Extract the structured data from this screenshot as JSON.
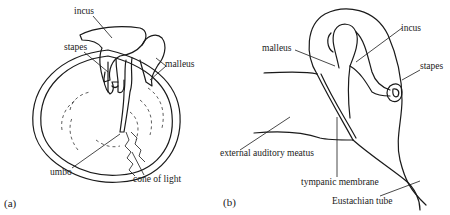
{
  "figure": {
    "panel_a": {
      "label": "(a)",
      "parts": {
        "incus": "incus",
        "stapes": "stapes",
        "malleus": "malleus",
        "umbo": "umbo",
        "cone_of_light": "cone of light"
      }
    },
    "panel_b": {
      "label": "(b)",
      "parts": {
        "malleus": "malleus",
        "incus": "incus",
        "stapes": "stapes",
        "external_auditory_meatus": "external auditory meatus",
        "tympanic_membrane": "tympanic membrane",
        "eustachian_tube": "Eustachian tube"
      }
    },
    "colors": {
      "line": "#1a1a1a",
      "background": "#ffffff"
    }
  }
}
